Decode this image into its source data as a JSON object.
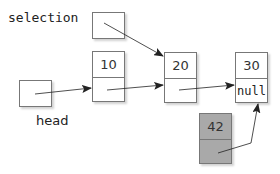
{
  "labels": {
    "selection": "selection",
    "head": "head"
  },
  "nodes": [
    {
      "value": "10",
      "next": ""
    },
    {
      "value": "20",
      "next": ""
    },
    {
      "value": "30",
      "next": "null"
    },
    {
      "value": "42",
      "next": ""
    }
  ],
  "colors": {
    "border": "#777777",
    "highlight_node_fill": "#a9a9a9",
    "arrow": "#222222"
  }
}
